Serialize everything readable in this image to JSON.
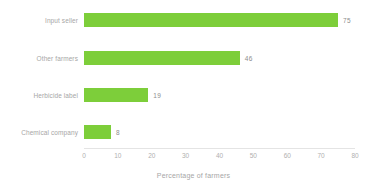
{
  "chart_data": {
    "type": "bar",
    "orientation": "horizontal",
    "title": "",
    "categories": [
      "Input seller",
      "Other farmers",
      "Herbicide label",
      "Chemical company"
    ],
    "values": [
      75,
      46,
      19,
      8
    ],
    "value_labels": [
      "75",
      "46",
      "19",
      "8"
    ],
    "xlabel": "Percentage of farmers",
    "ylabel": "",
    "xlim": [
      0,
      80
    ],
    "xticks": [
      0,
      10,
      20,
      30,
      40,
      50,
      60,
      70,
      80
    ],
    "xtick_labels": [
      "0",
      "10",
      "20",
      "30",
      "40",
      "50",
      "60",
      "70",
      "80"
    ],
    "grid": false,
    "legend": false,
    "bar_color": "#7DCE3A",
    "label_color": "#a6a6a6",
    "value_color": "#8d8d8d",
    "axis_color": "#e4e4e4"
  }
}
